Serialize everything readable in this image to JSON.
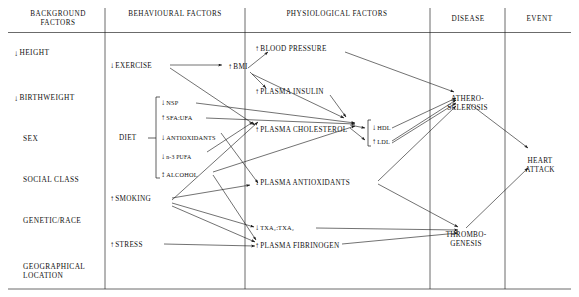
{
  "diagram": {
    "headers": [
      {
        "id": "background",
        "label": "BACKGROUND\nFACTORS"
      },
      {
        "id": "behavioural",
        "label": "BEHAVIOURAL\nFACTORS"
      },
      {
        "id": "physiological",
        "label": "PHYSIOLOGICAL\nFACTORS"
      },
      {
        "id": "disease",
        "label": "DISEASE"
      },
      {
        "id": "event",
        "label": "EVENT"
      }
    ],
    "columns": {
      "background": {
        "header": "BACKGROUND FACTORS",
        "nodes": [
          {
            "id": "height",
            "arrow": "↓",
            "label": "HEIGHT"
          },
          {
            "id": "birthweight",
            "arrow": "↓",
            "label": "BIRTHWEIGHT"
          },
          {
            "id": "sex",
            "arrow": "",
            "label": "SEX"
          },
          {
            "id": "social-class",
            "arrow": "",
            "label": "SOCIAL CLASS"
          },
          {
            "id": "genetic-race",
            "arrow": "",
            "label": "GENETIC/RACE"
          },
          {
            "id": "geographical-location",
            "arrow": "",
            "label": "GEOGRAPHICAL\nLOCATION"
          }
        ]
      },
      "behavioural": {
        "header": "BEHAVIOURAL FACTORS",
        "nodes": [
          {
            "id": "exercise",
            "arrow": "↓",
            "label": "EXERCISE"
          },
          {
            "id": "diet",
            "arrow": "",
            "label": "DIET"
          },
          {
            "id": "smoking",
            "arrow": "↑",
            "label": "SMOKING"
          },
          {
            "id": "stress",
            "arrow": "↑",
            "label": "STRESS"
          }
        ],
        "diet_items": [
          {
            "id": "nsp",
            "arrow": "↓",
            "label": "NSP"
          },
          {
            "id": "sfa-ufa",
            "arrow": "↑",
            "label": "SFA:UFA"
          },
          {
            "id": "antioxidants",
            "arrow": "↓",
            "label": "ANTIOXIDANTS"
          },
          {
            "id": "n3-pufa",
            "arrow": "↓",
            "label": "n-3 PUFA"
          },
          {
            "id": "alcohol",
            "arrow": "↕",
            "label": "ALCOHOL"
          }
        ]
      },
      "physiological": {
        "header": "PHYSIOLOGICAL FACTORS",
        "nodes": [
          {
            "id": "blood-pressure",
            "arrow": "↑",
            "label": "BLOOD PRESSURE"
          },
          {
            "id": "bmi",
            "arrow": "↑",
            "label": "BMI"
          },
          {
            "id": "plasma-insulin",
            "arrow": "↑",
            "label": "PLASMA INSULIN"
          },
          {
            "id": "plasma-cholesterol",
            "arrow": "↑",
            "label": "PLASMA CHOLESTEROL"
          },
          {
            "id": "plasma-antioxidants",
            "arrow": "↓",
            "label": "PLASMA ANTIOXIDANTS"
          },
          {
            "id": "txa-ratio",
            "arrow": "↓",
            "label": "TXA₂:TXA₂"
          },
          {
            "id": "plasma-fibrinogen",
            "arrow": "↑",
            "label": "PLASMA FIBRINOGEN"
          }
        ],
        "lipid_items": [
          {
            "id": "hdl",
            "arrow": "↓",
            "label": "HDL"
          },
          {
            "id": "ldl",
            "arrow": "↑",
            "label": "LDL"
          }
        ]
      },
      "disease": {
        "header": "DISEASE",
        "nodes": [
          {
            "id": "atherosclerosis",
            "arrow": "",
            "label": "ATHERO-\nSCLEROSIS"
          },
          {
            "id": "thrombogenesis",
            "arrow": "",
            "label": "THROMBO-\nGENESIS"
          }
        ]
      },
      "event": {
        "header": "EVENT",
        "nodes": [
          {
            "id": "heart-attack",
            "arrow": "",
            "label": "HEART\nATTACK"
          }
        ]
      }
    },
    "colors": {
      "line": "#1a1a1a",
      "text": "#111111",
      "background": "#ffffff"
    }
  }
}
